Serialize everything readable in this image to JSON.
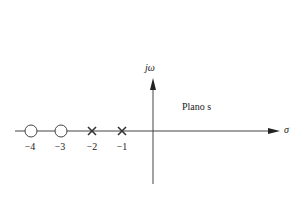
{
  "diagram": {
    "plane_label": "Plano s",
    "plane_var": "s",
    "vertical_axis_label": "jω",
    "horizontal_axis_label": "σ",
    "zeros": [
      {
        "value": -4,
        "label": "−4",
        "marker": "circle"
      },
      {
        "value": -3,
        "label": "−3",
        "marker": "circle"
      }
    ],
    "poles": [
      {
        "value": -2,
        "label": "−2",
        "marker": "x"
      },
      {
        "value": -1,
        "label": "−1",
        "marker": "x"
      }
    ],
    "colors": {
      "line": "#333333",
      "text": "#222222"
    }
  }
}
